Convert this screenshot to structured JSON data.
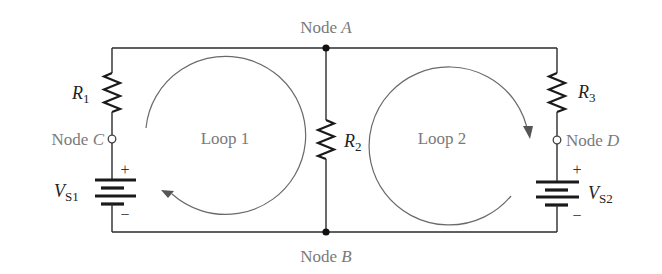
{
  "diagram": {
    "type": "circuit-schematic",
    "nodes": {
      "A": {
        "prefix": "Node ",
        "letter": "A"
      },
      "B": {
        "prefix": "Node ",
        "letter": "B"
      },
      "C": {
        "prefix": "Node ",
        "letter": "C"
      },
      "D": {
        "prefix": "Node ",
        "letter": "D"
      }
    },
    "loops": [
      {
        "label": "Loop 1",
        "direction": "clockwise"
      },
      {
        "label": "Loop 2",
        "direction": "clockwise"
      }
    ],
    "resistors": [
      {
        "symbol": "R",
        "subscript": "1"
      },
      {
        "symbol": "R",
        "subscript": "2"
      },
      {
        "symbol": "R",
        "subscript": "3"
      }
    ],
    "sources": [
      {
        "symbol": "V",
        "subscript": "S1",
        "plus": "+",
        "minus": "−"
      },
      {
        "symbol": "V",
        "subscript": "S2",
        "plus": "+",
        "minus": "−"
      }
    ],
    "colors": {
      "wire": "#2b2b2b",
      "label_gray": "#7a7a7a",
      "label_dark": "#222222",
      "loop_arrow": "#6a6a6a"
    }
  }
}
